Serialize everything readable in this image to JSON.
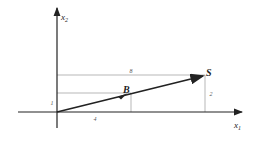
{
  "diagram": {
    "axes": {
      "x_label": "x",
      "x_subscript": "1",
      "y_label": "x",
      "y_subscript": "2"
    },
    "points": {
      "B": {
        "label": "B",
        "coords": [
          4,
          1
        ]
      },
      "S": {
        "label": "S",
        "coords": [
          8,
          2
        ]
      }
    },
    "annotations": {
      "top_horizontal": "8",
      "left_vertical": "1",
      "bottom_horizontal": "4",
      "right_vertical": "2"
    },
    "colors": {
      "axis": "#222222",
      "vector": "#222222",
      "guide": "#9a9a9a"
    }
  }
}
